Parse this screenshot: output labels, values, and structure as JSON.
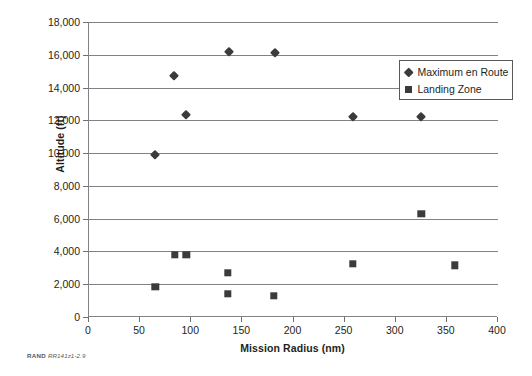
{
  "chart_data": {
    "type": "scatter",
    "title": "",
    "xlabel": "Mission Radius (nm)",
    "ylabel": "Altitude (ft)",
    "xlim": [
      0,
      400
    ],
    "ylim": [
      0,
      18000
    ],
    "xticks": [
      "0",
      "50",
      "100",
      "150",
      "200",
      "250",
      "300",
      "350",
      "400"
    ],
    "xtick_values": [
      0,
      50,
      100,
      150,
      200,
      250,
      300,
      350,
      400
    ],
    "yticks": [
      "0",
      "2,000",
      "4,000",
      "6,000",
      "8,000",
      "10,000",
      "12,000",
      "14,000",
      "16,000",
      "18,000"
    ],
    "ytick_values": [
      0,
      2000,
      4000,
      6000,
      8000,
      10000,
      12000,
      14000,
      16000,
      18000
    ],
    "grid": "horizontal",
    "legend_position": "upper-center-right",
    "series": [
      {
        "name": "Maximum en Route",
        "marker": "diamond",
        "color": "#3b3b3d",
        "points": [
          {
            "x": 65,
            "y": 9900
          },
          {
            "x": 83,
            "y": 14700
          },
          {
            "x": 95,
            "y": 12350
          },
          {
            "x": 137,
            "y": 16150
          },
          {
            "x": 182,
            "y": 16100
          },
          {
            "x": 258,
            "y": 12200
          },
          {
            "x": 325,
            "y": 12200
          },
          {
            "x": 358,
            "y": 14400
          }
        ]
      },
      {
        "name": "Landing Zone",
        "marker": "square",
        "color": "#3b3b3d",
        "points": [
          {
            "x": 65,
            "y": 1850
          },
          {
            "x": 84,
            "y": 3800
          },
          {
            "x": 95,
            "y": 3800
          },
          {
            "x": 136,
            "y": 2680
          },
          {
            "x": 136,
            "y": 1400
          },
          {
            "x": 181,
            "y": 1280
          },
          {
            "x": 258,
            "y": 3250
          },
          {
            "x": 325,
            "y": 6300
          },
          {
            "x": 358,
            "y": 3150
          }
        ]
      }
    ]
  },
  "legend": {
    "items": [
      {
        "label": "Maximum en Route",
        "marker": "diamond"
      },
      {
        "label": "Landing Zone",
        "marker": "square"
      }
    ]
  },
  "caption": {
    "organization": "RAND",
    "figure_id": "RR141z1-2.9"
  }
}
